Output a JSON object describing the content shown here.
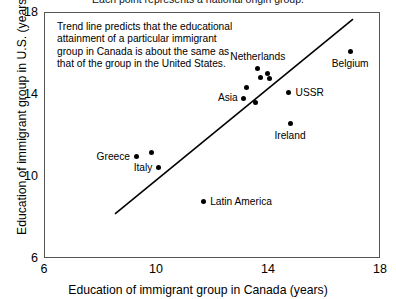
{
  "caption": {
    "top": "Each point represents a national origin group."
  },
  "annotation": {
    "text": "Trend line predicts that the educational attainment of a particular immigrant group in Canada is about the same as that of the group in the United States."
  },
  "axes": {
    "x_title": "Education of immigrant group in Canada (years)",
    "y_title": "Education of immigrant group in U.S. (years)",
    "x_ticks": [
      "6",
      "10",
      "14",
      "18"
    ],
    "y_ticks": [
      "18",
      "14",
      "10",
      "6"
    ]
  },
  "chart_data": {
    "type": "scatter",
    "title": "Each point represents a national origin group.",
    "xlabel": "Education of immigrant group in Canada (years)",
    "ylabel": "Education of immigrant group in U.S. (years)",
    "xlim": [
      6,
      18
    ],
    "ylim": [
      6,
      18
    ],
    "xticks": [
      6,
      10,
      14,
      18
    ],
    "yticks": [
      6,
      10,
      14,
      18
    ],
    "grid": false,
    "legend": "none",
    "annotations": [
      {
        "text": "Trend line predicts that the educational attainment of a particular immigrant group in Canada is about the same as that of the group in the United States.",
        "x": 7.0,
        "y": 17.3
      }
    ],
    "trend_line": {
      "label": "trend line",
      "x": [
        8.5,
        17.0
      ],
      "y": [
        8.2,
        17.7
      ]
    },
    "points": [
      {
        "label": "Greece",
        "x": 9.25,
        "y": 11.0,
        "label_pos": "left"
      },
      {
        "label": "",
        "x": 9.8,
        "y": 11.2,
        "label_pos": "none"
      },
      {
        "label": "Italy",
        "x": 10.05,
        "y": 10.45,
        "label_pos": "left"
      },
      {
        "label": "Latin America",
        "x": 11.65,
        "y": 8.8,
        "label_pos": "right"
      },
      {
        "label": "Asia",
        "x": 13.1,
        "y": 13.85,
        "label_pos": "left"
      },
      {
        "label": "",
        "x": 13.5,
        "y": 13.65,
        "label_pos": "none"
      },
      {
        "label": "",
        "x": 13.2,
        "y": 14.35,
        "label_pos": "none"
      },
      {
        "label": "Netherlands",
        "x": 13.6,
        "y": 15.3,
        "label_pos": "above"
      },
      {
        "label": "",
        "x": 13.7,
        "y": 14.85,
        "label_pos": "none"
      },
      {
        "label": "",
        "x": 13.95,
        "y": 15.05,
        "label_pos": "none"
      },
      {
        "label": "",
        "x": 14.0,
        "y": 14.8,
        "label_pos": "none"
      },
      {
        "label": "USSR",
        "x": 14.7,
        "y": 14.1,
        "label_pos": "right"
      },
      {
        "label": "Ireland",
        "x": 14.75,
        "y": 12.6,
        "label_pos": "below"
      },
      {
        "label": "Belgium",
        "x": 16.9,
        "y": 16.1,
        "label_pos": "below"
      }
    ]
  }
}
